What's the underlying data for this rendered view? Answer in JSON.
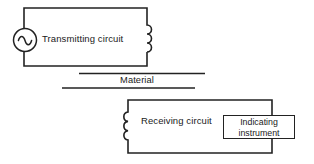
{
  "diagram": {
    "colors": {
      "background": "#ffffff",
      "line": "#222222"
    },
    "icons": {
      "ac_source": "ac-sine-wave-source",
      "transmitting_inductor": "coil-3-turns",
      "receiving_inductor": "coil-3-turns"
    },
    "transmitting_circuit": {
      "label": "Transmitting circuit"
    },
    "material": {
      "label": "Material"
    },
    "receiving_circuit": {
      "label": "Receiving circuit"
    },
    "indicating_instrument": {
      "label_line1": "Indicating",
      "label_line2": "instrument"
    }
  }
}
